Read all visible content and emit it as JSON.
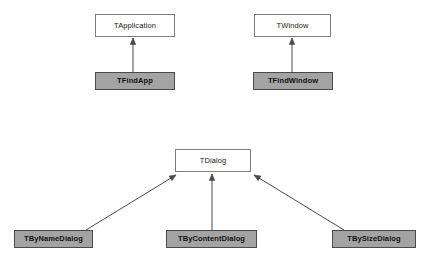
{
  "diagram": {
    "type": "uml-class-hierarchy",
    "title": "",
    "background_color": "#ffffff",
    "styles": {
      "base_class_fill": "#ffffff",
      "base_class_border": "#7d7d7d",
      "derived_class_fill": "#a3a3a3",
      "derived_class_border": "#4a4a4a",
      "edge_color": "#4a4a4a"
    },
    "nodes": [
      {
        "id": "tapplication",
        "label": "TApplication",
        "kind": "base",
        "x": 95,
        "y": 14,
        "w": 80,
        "h": 23
      },
      {
        "id": "tfindapp",
        "label": "TFindApp",
        "kind": "derived",
        "x": 95,
        "y": 72,
        "w": 80,
        "h": 18
      },
      {
        "id": "twindow",
        "label": "TWindow",
        "kind": "base",
        "x": 254,
        "y": 14,
        "w": 77,
        "h": 23
      },
      {
        "id": "tfindwindow",
        "label": "TFindWindow",
        "kind": "derived",
        "x": 253,
        "y": 72,
        "w": 80,
        "h": 18
      },
      {
        "id": "tdialog",
        "label": "TDialog",
        "kind": "base",
        "x": 175,
        "y": 149,
        "w": 76,
        "h": 23
      },
      {
        "id": "tbynamedialog",
        "label": "TByNameDialog",
        "kind": "derived",
        "x": 14,
        "y": 230,
        "w": 79,
        "h": 18
      },
      {
        "id": "tbycontentdialog",
        "label": "TByContentDialog",
        "kind": "derived",
        "x": 166,
        "y": 230,
        "w": 91,
        "h": 18
      },
      {
        "id": "tbysizedialog",
        "label": "TBySizeDialog",
        "kind": "derived",
        "x": 332,
        "y": 230,
        "w": 84,
        "h": 18
      }
    ],
    "edges": [
      {
        "id": "tfindapp-to-tapplication",
        "from": "tfindapp",
        "to": "tapplication",
        "relation": "generalization",
        "x1": 133,
        "y1": 72,
        "x2": 133,
        "y2": 38
      },
      {
        "id": "tfindwindow-to-twindow",
        "from": "tfindwindow",
        "to": "twindow",
        "relation": "generalization",
        "x1": 292,
        "y1": 72,
        "x2": 292,
        "y2": 38
      },
      {
        "id": "tbynamedialog-to-tdialog",
        "from": "tbynamedialog",
        "to": "tdialog",
        "relation": "generalization",
        "x1": 86,
        "y1": 230,
        "x2": 176,
        "y2": 175
      },
      {
        "id": "tbycontentdialog-to-tdialog",
        "from": "tbycontentdialog",
        "to": "tdialog",
        "relation": "generalization",
        "x1": 212,
        "y1": 230,
        "x2": 212,
        "y2": 174
      },
      {
        "id": "tbysizedialog-to-tdialog",
        "from": "tbysizedialog",
        "to": "tdialog",
        "relation": "generalization",
        "x1": 344,
        "y1": 230,
        "x2": 254,
        "y2": 175
      }
    ]
  }
}
